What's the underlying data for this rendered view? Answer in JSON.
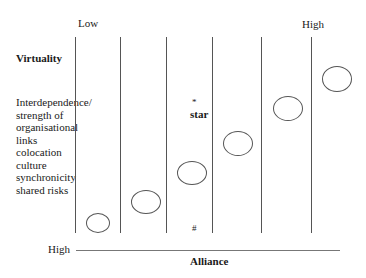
{
  "diagram": {
    "top_axis": {
      "low_label": "Low",
      "high_label": "High"
    },
    "row_label": "Virtuality",
    "criteria": [
      "Interdependence/",
      "strength of",
      "organisational",
      "links",
      "colocation",
      "culture",
      "synchronicity",
      "shared risks"
    ],
    "star_marker": "*",
    "star_label": "star",
    "hash_marker": "#",
    "bottom_axis": {
      "high_label": "High",
      "title": "Alliance"
    },
    "columns": 6,
    "ellipses_ascending_left_to_right": 7
  }
}
